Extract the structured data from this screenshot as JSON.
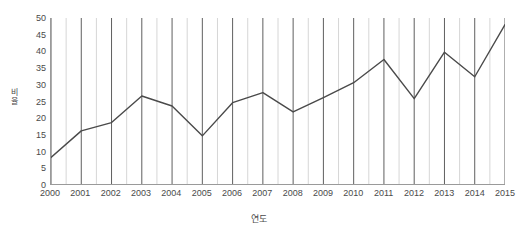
{
  "chart_data": {
    "type": "line",
    "title": "",
    "xlabel": "연도",
    "ylabel": "비율",
    "categories": [
      "2000",
      "2001",
      "2002",
      "2003",
      "2004",
      "2005",
      "2006",
      "2007",
      "2008",
      "2009",
      "2010",
      "2011",
      "2012",
      "2013",
      "2014",
      "2015"
    ],
    "values": [
      8,
      16,
      18.5,
      26.5,
      23.5,
      14.5,
      24.5,
      27.5,
      21.7,
      26,
      30.5,
      37.5,
      25.7,
      39.7,
      32.3,
      48
    ],
    "series": [
      {
        "name": "비율",
        "values": [
          8,
          16,
          18.5,
          26.5,
          23.5,
          14.5,
          24.5,
          27.5,
          21.7,
          26,
          30.5,
          37.5,
          25.7,
          39.7,
          32.3,
          48
        ]
      }
    ],
    "ylim": [
      0,
      50
    ],
    "ytick_labels": [
      "50",
      "45",
      "40",
      "35",
      "30",
      "25",
      "20",
      "15",
      "10",
      "5",
      "0"
    ],
    "ytick_values": [
      50,
      45,
      40,
      35,
      30,
      25,
      20,
      15,
      10,
      5,
      0
    ],
    "grid": {
      "vertical": true,
      "horizontal": false,
      "major_color": "#5f5f5f",
      "minor_color": "#d6d6d6"
    },
    "legend": null,
    "line_color": "#4a4a4a",
    "markers": false,
    "axis_color": "#9a9a9a"
  }
}
